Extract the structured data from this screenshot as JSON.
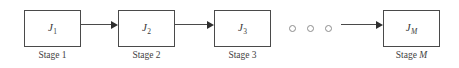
{
  "diagram": {
    "type": "flow",
    "colors": {
      "box_border": "#4a4a4a",
      "arrow": "#2e2e2e",
      "dot_border": "#8d8d8d",
      "text": "#3a3a3a",
      "background": "#ffffff"
    },
    "nodes": [
      {
        "id": "stage-1",
        "label_base": "J",
        "label_sub": "1",
        "sub_italic": false,
        "caption_text": "Stage ",
        "caption_suffix": "1",
        "caption_suffix_italic": false,
        "x": 24,
        "y": 10,
        "width": 57,
        "height": 37
      },
      {
        "id": "stage-2",
        "label_base": "J",
        "label_sub": "2",
        "sub_italic": false,
        "caption_text": "Stage ",
        "caption_suffix": "2",
        "caption_suffix_italic": false,
        "x": 118,
        "y": 10,
        "width": 57,
        "height": 37
      },
      {
        "id": "stage-3",
        "label_base": "J",
        "label_sub": "3",
        "sub_italic": false,
        "caption_text": "Stage ",
        "caption_suffix": "3",
        "caption_suffix_italic": false,
        "x": 214,
        "y": 10,
        "width": 57,
        "height": 37
      },
      {
        "id": "stage-m",
        "label_base": "J",
        "label_sub": "M",
        "sub_italic": true,
        "caption_text": "Stage ",
        "caption_suffix": "M",
        "caption_suffix_italic": true,
        "x": 383,
        "y": 10,
        "width": 57,
        "height": 37
      }
    ],
    "connectors": [
      {
        "id": "arrow-1-2",
        "from": "stage-1",
        "to": "stage-2",
        "x": 81,
        "y": 24,
        "length": 37
      },
      {
        "id": "arrow-2-3",
        "from": "stage-2",
        "to": "stage-3",
        "x": 175,
        "y": 24,
        "length": 39
      },
      {
        "id": "arrow-dots-m",
        "from": "ellipsis",
        "to": "stage-m",
        "x": 341,
        "y": 24,
        "length": 42
      }
    ],
    "ellipsis": {
      "id": "continuation-dots",
      "count": 3,
      "y": 25,
      "dots_x": [
        289,
        307,
        325
      ]
    }
  }
}
